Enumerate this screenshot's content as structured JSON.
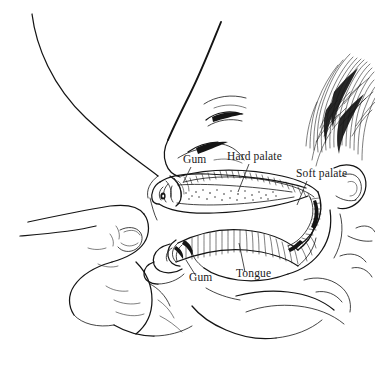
{
  "figure": {
    "background_color": "#ffffff",
    "ink_color": "#141414",
    "text_color": "#1a1a1a",
    "width": 375,
    "height": 367
  },
  "labels": [
    {
      "id": "gum-upper",
      "text": "Gum",
      "x": 183,
      "y": 163
    },
    {
      "id": "hard-palate",
      "text": "Hard palate",
      "x": 227,
      "y": 160
    },
    {
      "id": "soft-palate",
      "text": "Soft palate",
      "x": 296,
      "y": 177
    },
    {
      "id": "gum-lower",
      "text": "Gum",
      "x": 189,
      "y": 281
    },
    {
      "id": "tongue",
      "text": "Tongue",
      "x": 236,
      "y": 277
    }
  ],
  "anatomy_parts": [
    "breast",
    "nipple",
    "areola",
    "supporting-finger",
    "infant-head",
    "infant-hair",
    "infant-eye",
    "infant-nose",
    "infant-ear",
    "infant-chin",
    "upper-gum",
    "lower-gum",
    "hard-palate",
    "soft-palate",
    "tongue"
  ]
}
